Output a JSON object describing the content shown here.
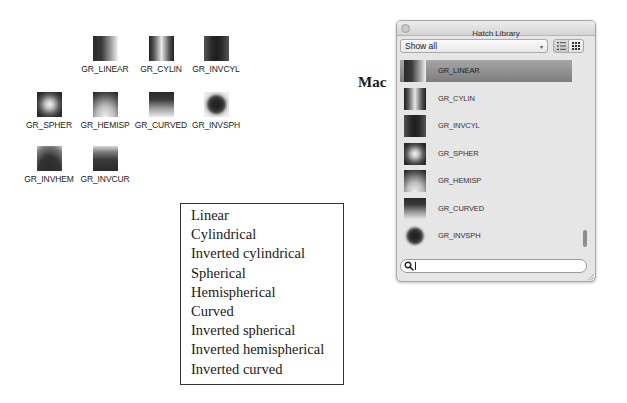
{
  "windows_icons": {
    "items": [
      {
        "label": "GR_LINEAR",
        "icon": "linear-gradient-icon",
        "x": 92,
        "y": 36
      },
      {
        "label": "GR_CYLIN",
        "icon": "cylindrical-gradient-icon",
        "x": 147,
        "y": 36
      },
      {
        "label": "GR_INVCYL",
        "icon": "inverted-cylindrical-gradient-icon",
        "x": 203,
        "y": 36
      },
      {
        "label": "GR_SPHER",
        "icon": "spherical-gradient-icon",
        "x": 26,
        "y": 92
      },
      {
        "label": "GR_HEMISP",
        "icon": "hemispherical-gradient-icon",
        "x": 92,
        "y": 92
      },
      {
        "label": "GR_CURVED",
        "icon": "curved-gradient-icon",
        "x": 147,
        "y": 92
      },
      {
        "label": "GR_INVSPH",
        "icon": "inverted-spherical-gradient-icon",
        "x": 203,
        "y": 92
      },
      {
        "label": "GR_INVHEM",
        "icon": "inverted-hemispherical-gradient-icon",
        "x": 26,
        "y": 146
      },
      {
        "label": "GR_INVCUR",
        "icon": "inverted-curved-gradient-icon",
        "x": 92,
        "y": 146
      }
    ]
  },
  "legend": {
    "lines": [
      "Linear",
      "Cylindrical",
      "Inverted cylindrical",
      "Spherical",
      "Hemispherical",
      "Curved",
      "Inverted spherical",
      "Inverted hemispherical",
      "Inverted curved"
    ]
  },
  "platform_label": "Mac",
  "mac_window": {
    "title": "Hatch Library",
    "filter_select": {
      "value": "Show all",
      "arrow": "▾"
    },
    "view_buttons": [
      {
        "name": "list-view",
        "active": true
      },
      {
        "name": "grid-view",
        "active": false
      }
    ],
    "list": [
      {
        "label": "GR_LINEAR",
        "selected": true
      },
      {
        "label": "GR_CYLIN",
        "selected": false
      },
      {
        "label": "GR_INVCYL",
        "selected": false
      },
      {
        "label": "GR_SPHER",
        "selected": false
      },
      {
        "label": "GR_HEMISP",
        "selected": false
      },
      {
        "label": "GR_CURVED",
        "selected": false
      },
      {
        "label": "GR_INVSPH",
        "selected": false
      }
    ],
    "search": {
      "value": "",
      "placeholder": ""
    }
  }
}
